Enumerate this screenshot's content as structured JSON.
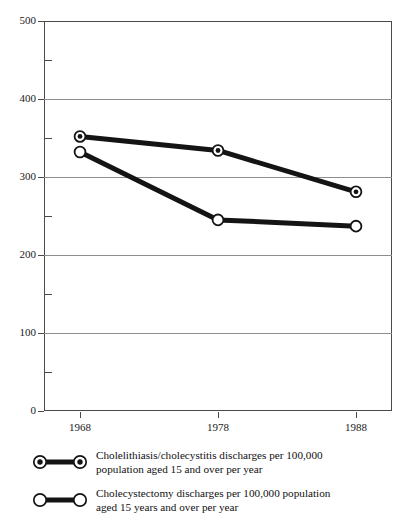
{
  "chart_data": {
    "type": "line",
    "title": "",
    "subtitle": "",
    "xlabel": "",
    "ylabel": "",
    "categories": [
      "1968",
      "1978",
      "1988"
    ],
    "x": [
      1968,
      1978,
      1988
    ],
    "xlim": [
      1963,
      1993
    ],
    "ylim": [
      0,
      500
    ],
    "y_ticks": [
      "0",
      "100",
      "200",
      "300",
      "400",
      "500"
    ],
    "y_tick_values": [
      0,
      100,
      200,
      300,
      400,
      500
    ],
    "y_minor_tick_values": [
      50,
      150,
      250,
      350,
      450
    ],
    "grid": "horizontal major gridlines only",
    "legend_position": "below plot",
    "series": [
      {
        "name": "Cholelithiasis/cholecystitis discharges per 100,000 population aged 15 and over per year",
        "marker": "bullseye-circle",
        "values": [
          352,
          334,
          281
        ]
      },
      {
        "name": "Cholecystectomy discharges per 100,000 population aged 15 years and over per year",
        "marker": "open-circle",
        "values": [
          332,
          245,
          237
        ]
      }
    ]
  },
  "axes": {
    "y_labels": [
      "500",
      "400",
      "300",
      "200",
      "100",
      "0"
    ],
    "x_labels": [
      "1968",
      "1978",
      "1988"
    ]
  },
  "legend": {
    "items": [
      {
        "marker": "bullseye-circle",
        "line1": "Cholelithiasis/cholecystitis discharges per 100,000",
        "line2": "population aged 15 and over per year"
      },
      {
        "marker": "open-circle",
        "line1": "Cholecystectomy discharges per 100,000 population",
        "line2": "aged 15 years and over per year"
      }
    ]
  },
  "colors": {
    "series_line": "#141414",
    "marker_fill": "#ffffff",
    "marker_stroke": "#141414",
    "gridline": "#8d8d8d",
    "frame": "#4a4a4a",
    "text": "#111111",
    "background": "#ffffff"
  }
}
